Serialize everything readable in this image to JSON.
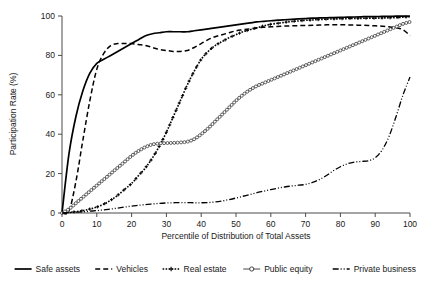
{
  "chart_data": {
    "type": "line",
    "title": "",
    "xlabel": "Percentile of Distribution of Total Assets",
    "ylabel": "Participation Rate (%)",
    "xlim": [
      0,
      100
    ],
    "ylim": [
      0,
      100
    ],
    "xticks": [
      0,
      10,
      20,
      30,
      40,
      50,
      60,
      70,
      80,
      90,
      100
    ],
    "yticks": [
      0,
      20,
      40,
      60,
      80,
      100
    ],
    "grid": false,
    "legend_position": "below",
    "x": [
      0,
      2,
      4,
      6,
      8,
      10,
      12,
      14,
      16,
      18,
      20,
      22,
      24,
      26,
      28,
      30,
      32,
      34,
      36,
      38,
      40,
      42,
      44,
      46,
      48,
      50,
      52,
      54,
      56,
      58,
      60,
      62,
      64,
      66,
      68,
      70,
      72,
      74,
      76,
      78,
      80,
      82,
      84,
      86,
      88,
      90,
      92,
      94,
      96,
      98,
      100
    ],
    "series": [
      {
        "name": "Safe assets",
        "style": "solid",
        "values": [
          0,
          30,
          49,
          62,
          71,
          76,
          78,
          80,
          82,
          84,
          86,
          88,
          90,
          91,
          91.5,
          92,
          92,
          92,
          92,
          92.5,
          93,
          93.5,
          94,
          94.5,
          95,
          95.5,
          96,
          96.5,
          97,
          97.3,
          97.6,
          97.9,
          98.1,
          98.3,
          98.5,
          98.7,
          98.9,
          99,
          99.1,
          99.2,
          99.3,
          99.4,
          99.5,
          99.6,
          99.7,
          99.7,
          99.8,
          99.8,
          99.9,
          99.9,
          100
        ]
      },
      {
        "name": "Vehicles",
        "style": "dashed",
        "values": [
          0,
          1,
          16,
          37,
          57,
          73,
          81,
          85,
          86,
          86,
          86,
          85.5,
          85,
          84,
          83,
          82.5,
          82,
          82,
          82.5,
          84,
          86,
          88,
          89.5,
          90.5,
          91.5,
          92.5,
          93,
          93.5,
          94,
          94.3,
          94.5,
          94.7,
          94.9,
          95,
          95.1,
          95.2,
          95.3,
          95.4,
          95.5,
          95.5,
          95.5,
          95.5,
          95.4,
          95.3,
          95.2,
          95,
          94.8,
          94.5,
          94,
          93,
          90
        ]
      },
      {
        "name": "Real estate",
        "style": "dotted-plus",
        "values": [
          0,
          0.3,
          0.7,
          1.2,
          2,
          3,
          4.5,
          6.5,
          9,
          12,
          15,
          19,
          23,
          28,
          34,
          41,
          49,
          57,
          65,
          72,
          78,
          82,
          85,
          87,
          89,
          90.5,
          92,
          93,
          94,
          95,
          95.8,
          96.3,
          96.8,
          97.2,
          97.5,
          97.8,
          98,
          98.2,
          98.4,
          98.5,
          98.6,
          98.7,
          98.8,
          98.8,
          98.9,
          98.9,
          99,
          99.1,
          99.2,
          99.4,
          99.6
        ]
      },
      {
        "name": "Public equity",
        "style": "open-circle",
        "values": [
          0,
          2,
          5,
          8,
          11,
          14,
          17,
          20,
          23,
          26,
          29,
          31.5,
          33.5,
          34.8,
          35.3,
          35.5,
          35.6,
          35.8,
          36.2,
          37.5,
          40,
          43,
          46.5,
          50,
          53.5,
          57,
          60,
          62.5,
          64.5,
          66,
          67.5,
          69,
          70.5,
          72,
          73.5,
          75,
          76.5,
          78,
          79.5,
          81,
          82.5,
          84,
          85.5,
          87,
          88.5,
          90,
          91.5,
          93,
          94.5,
          96,
          97
        ]
      },
      {
        "name": "Private business",
        "style": "dash-dot-dot",
        "values": [
          0,
          0.2,
          0.4,
          0.6,
          0.9,
          1.2,
          1.6,
          2,
          2.5,
          3,
          3.5,
          3.9,
          4.3,
          4.6,
          4.9,
          5.1,
          5.2,
          5.3,
          5.3,
          5.2,
          5.2,
          5.3,
          5.6,
          6.1,
          6.8,
          7.6,
          8.5,
          9.4,
          10.3,
          11.1,
          11.9,
          12.6,
          13.2,
          13.7,
          14.1,
          14.5,
          15.5,
          17,
          19,
          21.5,
          23.5,
          25,
          25.8,
          26.2,
          26.5,
          28,
          32,
          39,
          49,
          60,
          69
        ]
      }
    ]
  },
  "legend": {
    "items": [
      {
        "label": "Safe assets",
        "style": "solid"
      },
      {
        "label": "Vehicles",
        "style": "dashed"
      },
      {
        "label": "Real estate",
        "style": "dotted-plus"
      },
      {
        "label": "Public equity",
        "style": "open-circle"
      },
      {
        "label": "Private business",
        "style": "dash-dot-dot"
      }
    ]
  }
}
